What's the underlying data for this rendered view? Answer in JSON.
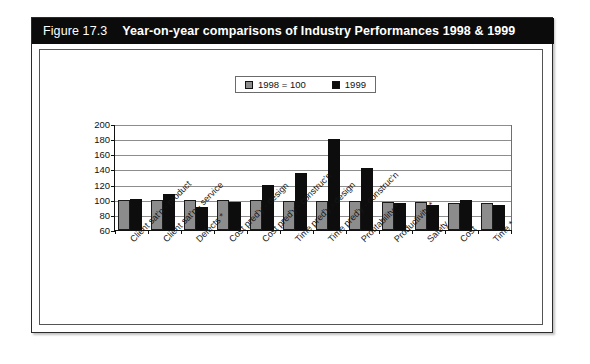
{
  "figure": {
    "number": "Figure 17.3",
    "title": "Year-on-year comparisons of Industry Performances 1998 & 1999"
  },
  "legend": {
    "position": "top-center",
    "entries": [
      {
        "label": "1998 =  100",
        "color": "#8c8c8c",
        "swatch": "gray-square-icon"
      },
      {
        "label": "1999",
        "color": "#0d0d0d",
        "swatch": "black-square-icon"
      }
    ]
  },
  "axis": {
    "y_ticks": [
      "200",
      "180",
      "160",
      "140",
      "120",
      "100",
      "80",
      "60"
    ]
  },
  "chart_data": {
    "type": "bar",
    "title": "Year-on-year comparisons of Industry Performances 1998 & 1999",
    "xlabel": "",
    "ylabel": "",
    "ylim": [
      60,
      200
    ],
    "ytick_step": 20,
    "grid": true,
    "legend_position": "top-center",
    "categories": [
      "Client sat'n - product",
      "Client sat'n - service",
      "Defects *",
      "Cost pred'y - design",
      "Cost pred'y - construc'n",
      "Time pred'y - design",
      "Time pred'y - construc'n",
      "Profitability *",
      "Productivity *",
      "Safety",
      "Cost",
      "Time *"
    ],
    "series": [
      {
        "name": "1998 =  100",
        "color": "#8c8c8c",
        "values": [
          100,
          100,
          99,
          99,
          99,
          98,
          98,
          98,
          97,
          97,
          96,
          96
        ]
      },
      {
        "name": "1999",
        "color": "#0d0d0d",
        "values": [
          101,
          108,
          91,
          97,
          120,
          135,
          180,
          142,
          96,
          93,
          99,
          93
        ]
      }
    ]
  }
}
